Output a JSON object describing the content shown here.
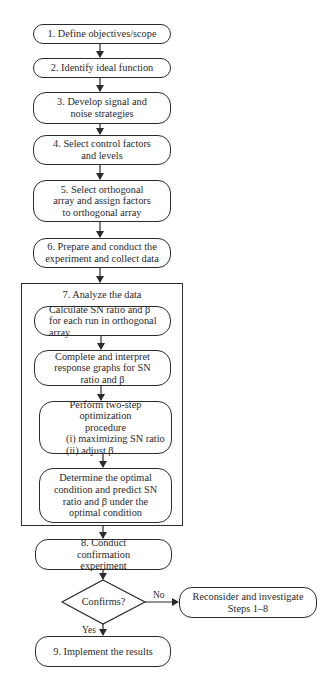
{
  "flowchart": {
    "steps": [
      {
        "id": "step1",
        "label": "1. Define objectives/scope"
      },
      {
        "id": "step2",
        "label": "2. Identify ideal function"
      },
      {
        "id": "step3",
        "label": "3. Develop signal and noise strategies"
      },
      {
        "id": "step4",
        "label": "4. Select control factors and levels"
      },
      {
        "id": "step5",
        "label": "5. Select orthogonal array and assign factors to orthogonal array"
      },
      {
        "id": "step6",
        "label": "6. Prepare and conduct the experiment and collect data"
      },
      {
        "id": "step8",
        "label": "8. Conduct confirmation experiment"
      },
      {
        "id": "step9",
        "label": "9. Implement the results"
      }
    ],
    "analyze_group": {
      "title": "7. Analyze the data",
      "substeps": [
        {
          "label": "Calculate SN ratio and β for each run in orthogonal array"
        },
        {
          "label": "Complete and interpret response graphs for SN ratio and β"
        },
        {
          "label_line1": "Perform two-step optimization",
          "label_line2": "procedure",
          "label_line3": "(i) maximizing SN ratio",
          "label_line4": "(ii) adjust β"
        },
        {
          "label": "Determine the optimal condition and predict SN ratio and β under the optimal condition"
        }
      ]
    },
    "decision": {
      "label": "Confirms?",
      "yes_label": "Yes",
      "no_label": "No"
    },
    "fallback": {
      "label_line1": "Reconsider and investigate",
      "label_line2": "Steps 1–8"
    }
  }
}
